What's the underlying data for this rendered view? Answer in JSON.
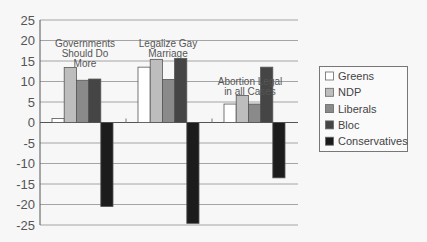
{
  "chart_data": {
    "type": "bar",
    "title": "",
    "xlabel": "",
    "ylabel": "",
    "ylim": [
      -25,
      25
    ],
    "yticks": [
      25,
      20,
      15,
      10,
      5,
      0,
      -5,
      -10,
      -15,
      -20,
      -25
    ],
    "ytick_labels": [
      "25",
      "20",
      "15",
      "10",
      "5",
      "0",
      "-5",
      "-10",
      "-15",
      "-20",
      "-25"
    ],
    "grid": true,
    "legend_position": "right",
    "categories": [
      "Governments Should Do More",
      "Legalize Gay Marriage",
      "Abortion Legal in all Cases"
    ],
    "category_label_lines": [
      [
        "Governments",
        "Should Do",
        "More"
      ],
      [
        "Legalize Gay",
        "Marriage"
      ],
      [
        "Abortion Legal",
        "in all Cases"
      ]
    ],
    "series": [
      {
        "name": "Greens",
        "color": "#ffffff",
        "values": [
          1,
          13.5,
          4.5
        ]
      },
      {
        "name": "NDP",
        "color": "#bdbdbd",
        "values": [
          13.4,
          15.4,
          6.6
        ]
      },
      {
        "name": "Liberals",
        "color": "#8a8a8a",
        "values": [
          10.3,
          10.5,
          4.5
        ]
      },
      {
        "name": "Bloc",
        "color": "#454545",
        "values": [
          10.6,
          15.6,
          13.5
        ]
      },
      {
        "name": "Conservatives",
        "color": "#1c1c1c",
        "values": [
          -20.5,
          -24.6,
          -13.5
        ]
      }
    ]
  }
}
